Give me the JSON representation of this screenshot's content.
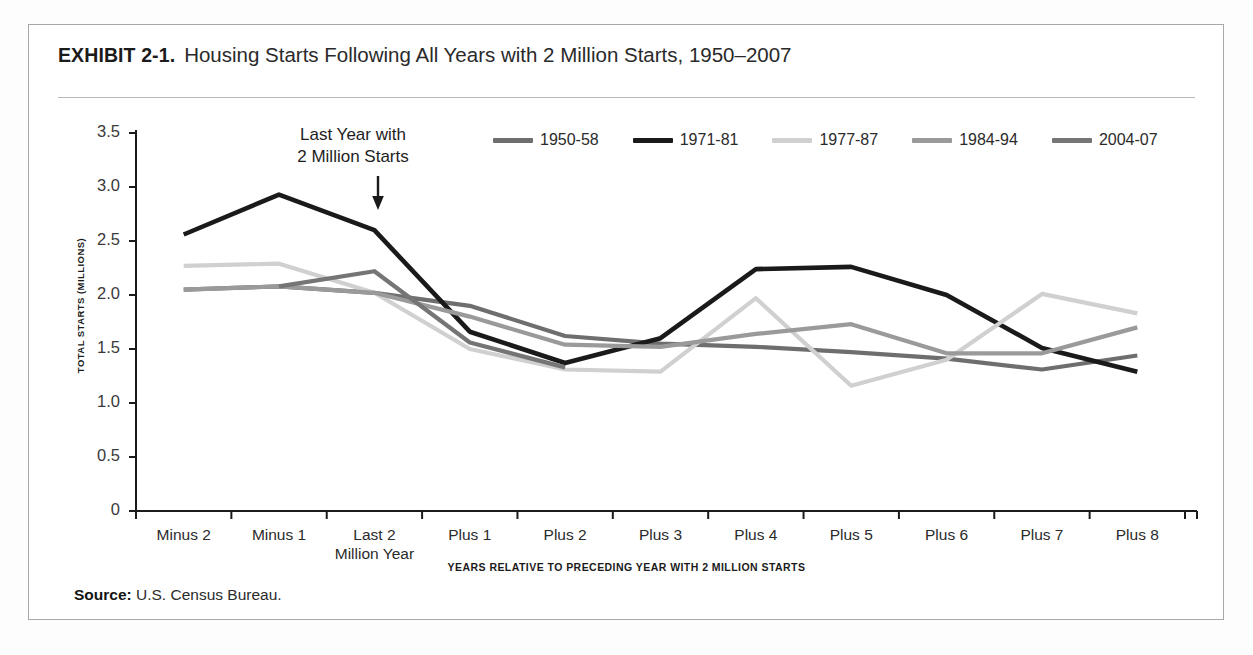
{
  "exhibit": {
    "label": "EXHIBIT 2-1.",
    "title": "Housing Starts Following All Years with 2 Million Starts, 1950–2007"
  },
  "annotation": {
    "line1": "Last Year with",
    "line2": "2 Million Starts",
    "arrow_icon": "down-arrow-icon"
  },
  "source": {
    "prefix": "Source:",
    "text": "U.S. Census Bureau."
  },
  "chart_data": {
    "type": "line",
    "title": "Housing Starts Following All Years with 2 Million Starts, 1950–2007",
    "xlabel": "YEARS RELATIVE TO PRECEDING YEAR WITH 2 MILLION STARTS",
    "ylabel": "TOTAL STARTS (MILLIONS)",
    "categories": [
      "Minus 2",
      "Minus 1",
      "Last 2 Million Year",
      "Plus 1",
      "Plus 2",
      "Plus 3",
      "Plus 4",
      "Plus 5",
      "Plus 6",
      "Plus 7",
      "Plus 8"
    ],
    "category_labels": [
      [
        "Minus 2"
      ],
      [
        "Minus 1"
      ],
      [
        "Last 2",
        "Million Year"
      ],
      [
        "Plus 1"
      ],
      [
        "Plus 2"
      ],
      [
        "Plus 3"
      ],
      [
        "Plus 4"
      ],
      [
        "Plus 5"
      ],
      [
        "Plus 6"
      ],
      [
        "Plus 7"
      ],
      [
        "Plus 8"
      ]
    ],
    "ylim": [
      0,
      3.5
    ],
    "yticks": [
      0,
      0.5,
      1.0,
      1.5,
      2.0,
      2.5,
      3.0,
      3.5
    ],
    "ytick_labels": [
      "0",
      "0.5",
      "1.0",
      "1.5",
      "2.0",
      "2.5",
      "3.0",
      "3.5"
    ],
    "grid": false,
    "legend_position": "top-center",
    "series": [
      {
        "name": "1950-58",
        "color": "#6e6e6e",
        "values": [
          2.05,
          2.08,
          2.02,
          1.9,
          1.62,
          1.55,
          1.52,
          1.47,
          1.41,
          1.31,
          1.44
        ]
      },
      {
        "name": "1971-81",
        "color": "#1a1a1a",
        "values": [
          2.56,
          2.93,
          2.6,
          1.66,
          1.37,
          1.6,
          2.24,
          2.26,
          2.0,
          1.51,
          1.29
        ]
      },
      {
        "name": "1977-87",
        "color": "#d0d0d0",
        "values": [
          2.27,
          2.29,
          2.02,
          1.5,
          1.31,
          1.29,
          1.97,
          1.16,
          1.4,
          2.01,
          1.83
        ]
      },
      {
        "name": "1984-94",
        "color": "#9a9a9a",
        "values": [
          2.05,
          2.08,
          2.02,
          1.8,
          1.54,
          1.52,
          1.64,
          1.73,
          1.46,
          1.46,
          1.7
        ]
      },
      {
        "name": "2004-07",
        "color": "#757575",
        "values": [
          null,
          2.08,
          2.22,
          1.56,
          1.33,
          null,
          null,
          null,
          null,
          null,
          null
        ]
      }
    ]
  }
}
